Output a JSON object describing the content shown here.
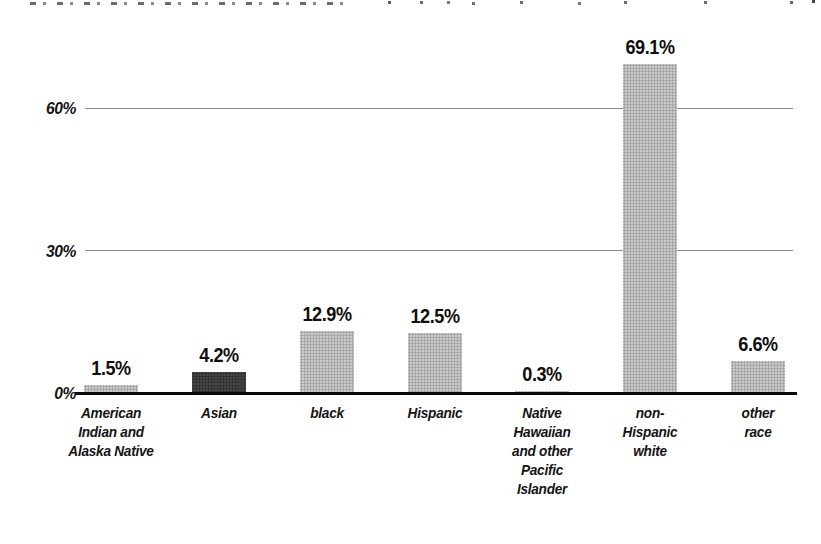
{
  "figure": {
    "background": "#ffffff"
  },
  "chart_data": {
    "type": "bar",
    "title": "",
    "xlabel": "",
    "ylabel": "",
    "ylim": [
      0,
      75
    ],
    "grid": "horizontal-lines-at-30-and-60",
    "legend": "none",
    "categories": [
      "American Indian and Alaska Native",
      "Asian",
      "black",
      "Hispanic",
      "Native Hawaiian and other Pacific Islander",
      "non-Hispanic white",
      "other race"
    ],
    "category_display": [
      "American\nIndian and\nAlaska Native",
      "Asian",
      "black",
      "Hispanic",
      "Native\nHawaiian\nand other\nPacific\nIslander",
      "non-\nHispanic\nwhite",
      "other\nrace"
    ],
    "values": [
      1.5,
      4.2,
      12.9,
      12.5,
      0.3,
      69.1,
      6.6
    ],
    "value_labels": [
      "1.5%",
      "4.2%",
      "12.9%",
      "12.5%",
      "0.3%",
      "69.1%",
      "6.6%"
    ],
    "bar_color_keys": [
      "light",
      "dark",
      "light",
      "light",
      "light",
      "light",
      "light"
    ],
    "palette": {
      "light": "#c8c8c8",
      "dark": "#3b3b3b"
    },
    "yticks": [
      {
        "value": 0,
        "label": "0%"
      },
      {
        "value": 30,
        "label": "30%"
      },
      {
        "value": 60,
        "label": "60%"
      }
    ],
    "axis_color": "#0a0a0a",
    "gridline_color": "#8d8d8d",
    "label_color": "#141414"
  }
}
